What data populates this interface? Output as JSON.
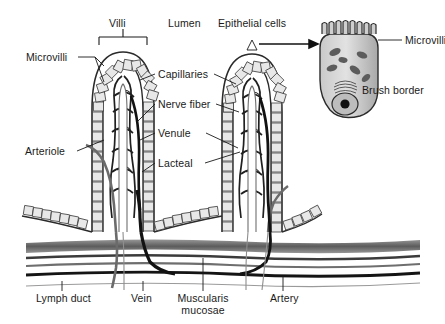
{
  "figure": {
    "background": "#ffffff",
    "ink": "#1a1a1a",
    "fill_light": "#d9d9d9",
    "fill_mid": "#9a9a9a",
    "fill_dark": "#3a3a3a"
  },
  "labels": {
    "villi": "Villi",
    "lumen": "Lumen",
    "epithelial_cells": "Epithelial cells",
    "microvilli_left": "Microvilli",
    "capillaries": "Capillaries",
    "nerve_fiber": "Nerve fiber",
    "venule": "Venule",
    "lacteal": "Lacteal",
    "arteriole": "Arteriole",
    "lymph_duct": "Lymph duct",
    "vein": "Vein",
    "muscularis_mucosae": "Muscularis mucosae",
    "artery": "Artery",
    "microvilli_inset": "Microvilli",
    "brush_border": "Brush border"
  },
  "icons": {
    "arrow": "magnify-arrow-icon",
    "bracket": "villi-bracket-icon"
  }
}
